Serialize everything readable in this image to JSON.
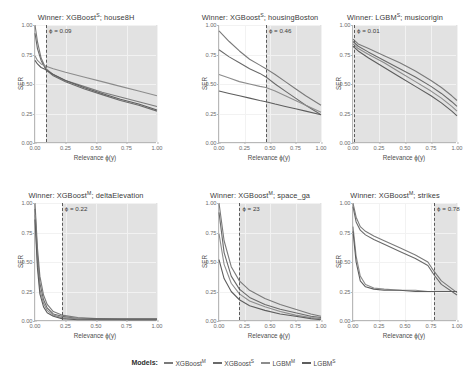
{
  "legend": {
    "label": "Models:",
    "items": [
      {
        "name": "XGBoost",
        "sup": "M",
        "color": "#7a7a7a"
      },
      {
        "name": "XGBoost",
        "sup": "S",
        "color": "#6a6a6a"
      },
      {
        "name": "LGBM",
        "sup": "M",
        "color": "#8c8c8c"
      },
      {
        "name": "LGBM",
        "sup": "S",
        "color": "#5d5d5d"
      }
    ]
  },
  "axis": {
    "xlabel": "Relevance ϕ(y)",
    "ylabel": "SER",
    "xticks": [
      "0.00",
      "0.25",
      "0.50",
      "0.75",
      "1.00"
    ],
    "yticks": [
      "0.00",
      "0.25",
      "0.50",
      "0.75",
      "1.00"
    ]
  },
  "chart_data": {
    "type": "line",
    "xlabel": "Relevance ϕ(y)",
    "ylabel": "SER",
    "xlim": [
      0.0,
      1.0
    ],
    "ylim": [
      0.0,
      1.0
    ],
    "grid": true,
    "legend_position": "bottom",
    "series_names": [
      "XGBoost^M",
      "XGBoost^S",
      "LGBM^M",
      "LGBM^S"
    ],
    "panels": [
      {
        "title_prefix": "Winner:",
        "winner": "XGBoost",
        "winner_sup": "S",
        "dataset": "house8H",
        "annotation": "ϕ = 0.09",
        "threshold": 0.09,
        "x": [
          0.0,
          0.02,
          0.05,
          0.09,
          0.15,
          0.25,
          0.4,
          0.55,
          0.7,
          0.85,
          1.0
        ],
        "series": [
          {
            "name": "XGBoost^M",
            "values": [
              1.0,
              0.86,
              0.72,
              0.63,
              0.58,
              0.53,
              0.48,
              0.43,
              0.39,
              0.35,
              0.31
            ]
          },
          {
            "name": "XGBoost^S",
            "values": [
              0.93,
              0.8,
              0.7,
              0.62,
              0.57,
              0.52,
              0.46,
              0.41,
              0.36,
              0.32,
              0.27
            ]
          },
          {
            "name": "LGBM^M",
            "values": [
              0.74,
              0.7,
              0.67,
              0.65,
              0.63,
              0.6,
              0.56,
              0.52,
              0.48,
              0.44,
              0.4
            ]
          },
          {
            "name": "LGBM^S",
            "values": [
              0.7,
              0.67,
              0.64,
              0.62,
              0.58,
              0.53,
              0.47,
              0.42,
              0.37,
              0.33,
              0.28
            ]
          }
        ]
      },
      {
        "title_prefix": "Winner:",
        "winner": "XGBoost",
        "winner_sup": "S",
        "dataset": "housingBoston",
        "annotation": "ϕ = 0.46",
        "threshold": 0.46,
        "x": [
          0.0,
          0.1,
          0.2,
          0.3,
          0.4,
          0.46,
          0.55,
          0.65,
          0.75,
          0.85,
          1.0
        ],
        "series": [
          {
            "name": "XGBoost^M",
            "values": [
              0.95,
              0.86,
              0.78,
              0.71,
              0.66,
              0.63,
              0.58,
              0.52,
              0.46,
              0.4,
              0.32
            ]
          },
          {
            "name": "XGBoost^S",
            "values": [
              0.79,
              0.73,
              0.68,
              0.63,
              0.59,
              0.56,
              0.5,
              0.44,
              0.38,
              0.32,
              0.24
            ]
          },
          {
            "name": "LGBM^M",
            "values": [
              0.58,
              0.55,
              0.52,
              0.5,
              0.48,
              0.47,
              0.44,
              0.4,
              0.36,
              0.32,
              0.26
            ]
          },
          {
            "name": "LGBM^S",
            "values": [
              0.44,
              0.42,
              0.4,
              0.38,
              0.36,
              0.35,
              0.33,
              0.31,
              0.29,
              0.27,
              0.24
            ]
          }
        ]
      },
      {
        "title_prefix": "Winner:",
        "winner": "LGBM",
        "winner_sup": "S",
        "dataset": "musicorigin",
        "annotation": "ϕ = 0.01",
        "threshold": 0.01,
        "x": [
          0.0,
          0.05,
          0.15,
          0.3,
          0.45,
          0.6,
          0.75,
          0.85,
          0.95,
          1.0
        ],
        "series": [
          {
            "name": "XGBoost^M",
            "values": [
              0.88,
              0.84,
              0.8,
              0.74,
              0.68,
              0.61,
              0.53,
              0.47,
              0.4,
              0.36
            ]
          },
          {
            "name": "XGBoost^S",
            "values": [
              0.86,
              0.82,
              0.77,
              0.7,
              0.63,
              0.56,
              0.48,
              0.42,
              0.35,
              0.31
            ]
          },
          {
            "name": "LGBM^M",
            "values": [
              0.84,
              0.8,
              0.75,
              0.68,
              0.6,
              0.52,
              0.44,
              0.38,
              0.31,
              0.27
            ]
          },
          {
            "name": "LGBM^S",
            "values": [
              0.82,
              0.78,
              0.72,
              0.64,
              0.56,
              0.48,
              0.4,
              0.34,
              0.27,
              0.23
            ]
          }
        ]
      },
      {
        "title_prefix": "Winner:",
        "winner": "XGBoost",
        "winner_sup": "M",
        "dataset": "deltaElevation",
        "annotation": "ϕ = 0.22",
        "threshold": 0.22,
        "x": [
          0.0,
          0.02,
          0.04,
          0.07,
          0.1,
          0.15,
          0.22,
          0.35,
          0.5,
          0.75,
          1.0
        ],
        "series": [
          {
            "name": "XGBoost^M",
            "values": [
              1.0,
              0.62,
              0.38,
              0.22,
              0.14,
              0.08,
              0.05,
              0.03,
              0.02,
              0.02,
              0.02
            ]
          },
          {
            "name": "XGBoost^S",
            "values": [
              0.95,
              0.56,
              0.32,
              0.18,
              0.11,
              0.06,
              0.04,
              0.02,
              0.02,
              0.01,
              0.01
            ]
          },
          {
            "name": "LGBM^M",
            "values": [
              0.9,
              0.5,
              0.27,
              0.15,
              0.09,
              0.05,
              0.03,
              0.02,
              0.01,
              0.01,
              0.01
            ]
          },
          {
            "name": "LGBM^S",
            "values": [
              0.86,
              0.45,
              0.23,
              0.12,
              0.07,
              0.04,
              0.02,
              0.01,
              0.01,
              0.01,
              0.01
            ]
          }
        ]
      },
      {
        "title_prefix": "Winner:",
        "winner": "XGBoost",
        "winner_sup": "M",
        "dataset": "space_ga",
        "annotation": "ϕ = 23",
        "threshold": 0.2,
        "x": [
          0.0,
          0.05,
          0.12,
          0.2,
          0.3,
          0.45,
          0.6,
          0.75,
          0.9,
          1.0
        ],
        "series": [
          {
            "name": "XGBoost^M",
            "values": [
              1.0,
              0.68,
              0.46,
              0.34,
              0.26,
              0.19,
              0.14,
              0.1,
              0.06,
              0.04
            ]
          },
          {
            "name": "XGBoost^S",
            "values": [
              0.92,
              0.58,
              0.38,
              0.27,
              0.2,
              0.14,
              0.1,
              0.07,
              0.04,
              0.03
            ]
          },
          {
            "name": "LGBM^M",
            "values": [
              0.74,
              0.48,
              0.32,
              0.23,
              0.17,
              0.12,
              0.08,
              0.05,
              0.03,
              0.02
            ]
          },
          {
            "name": "LGBM^S",
            "values": [
              0.52,
              0.36,
              0.25,
              0.18,
              0.13,
              0.09,
              0.06,
              0.04,
              0.02,
              0.01
            ]
          }
        ]
      },
      {
        "title_prefix": "Winner:",
        "winner": "XGBoost",
        "winner_sup": "M",
        "dataset": "strikes",
        "annotation": "ϕ = 0.78",
        "threshold": 0.78,
        "x": [
          0.0,
          0.03,
          0.07,
          0.12,
          0.2,
          0.3,
          0.45,
          0.6,
          0.72,
          0.78,
          0.85,
          1.0
        ],
        "series": [
          {
            "name": "XGBoost^M",
            "values": [
              1.0,
              0.88,
              0.8,
              0.76,
              0.72,
              0.68,
              0.62,
              0.56,
              0.5,
              0.42,
              0.34,
              0.24
            ]
          },
          {
            "name": "XGBoost^S",
            "values": [
              0.97,
              0.84,
              0.77,
              0.73,
              0.69,
              0.65,
              0.59,
              0.53,
              0.47,
              0.39,
              0.31,
              0.22
            ]
          },
          {
            "name": "LGBM^M",
            "values": [
              0.8,
              0.55,
              0.38,
              0.31,
              0.28,
              0.27,
              0.26,
              0.26,
              0.25,
              0.25,
              0.25,
              0.25
            ]
          },
          {
            "name": "LGBM^S",
            "values": [
              0.76,
              0.5,
              0.34,
              0.29,
              0.27,
              0.26,
              0.26,
              0.25,
              0.25,
              0.25,
              0.25,
              0.25
            ]
          }
        ]
      }
    ]
  }
}
